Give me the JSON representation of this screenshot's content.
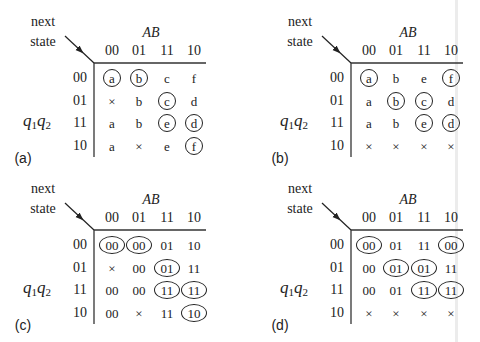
{
  "labels": {
    "next": "next",
    "state": "state",
    "ab": "AB",
    "q1": "q",
    "q1_sub": "1",
    "q2": "q",
    "q2_sub": "2"
  },
  "columns": [
    "00",
    "01",
    "11",
    "10"
  ],
  "rows": [
    "00",
    "01",
    "11",
    "10"
  ],
  "panels": [
    {
      "tag": "(a)",
      "cells": [
        [
          {
            "v": "a",
            "c": true
          },
          {
            "v": "b",
            "c": true
          },
          {
            "v": "c",
            "c": false
          },
          {
            "v": "f",
            "c": false
          }
        ],
        [
          {
            "v": "×",
            "c": false
          },
          {
            "v": "b",
            "c": false
          },
          {
            "v": "c",
            "c": true
          },
          {
            "v": "d",
            "c": false
          }
        ],
        [
          {
            "v": "a",
            "c": false
          },
          {
            "v": "b",
            "c": false
          },
          {
            "v": "e",
            "c": true
          },
          {
            "v": "d",
            "c": true
          }
        ],
        [
          {
            "v": "a",
            "c": false
          },
          {
            "v": "×",
            "c": false
          },
          {
            "v": "e",
            "c": false
          },
          {
            "v": "f",
            "c": true
          }
        ]
      ]
    },
    {
      "tag": "(b)",
      "cells": [
        [
          {
            "v": "a",
            "c": true
          },
          {
            "v": "b",
            "c": false
          },
          {
            "v": "e",
            "c": false
          },
          {
            "v": "f",
            "c": true
          }
        ],
        [
          {
            "v": "a",
            "c": false
          },
          {
            "v": "b",
            "c": true
          },
          {
            "v": "c",
            "c": true
          },
          {
            "v": "d",
            "c": false
          }
        ],
        [
          {
            "v": "a",
            "c": false
          },
          {
            "v": "b",
            "c": false
          },
          {
            "v": "e",
            "c": true
          },
          {
            "v": "d",
            "c": true
          }
        ],
        [
          {
            "v": "×",
            "c": false
          },
          {
            "v": "×",
            "c": false
          },
          {
            "v": "×",
            "c": false
          },
          {
            "v": "×",
            "c": false
          }
        ]
      ]
    },
    {
      "tag": "(c)",
      "cells": [
        [
          {
            "v": "00",
            "c": true
          },
          {
            "v": "00",
            "c": true
          },
          {
            "v": "01",
            "c": false
          },
          {
            "v": "10",
            "c": false
          }
        ],
        [
          {
            "v": "×",
            "c": false
          },
          {
            "v": "00",
            "c": false
          },
          {
            "v": "01",
            "c": true
          },
          {
            "v": "11",
            "c": false
          }
        ],
        [
          {
            "v": "00",
            "c": false
          },
          {
            "v": "00",
            "c": false
          },
          {
            "v": "11",
            "c": true
          },
          {
            "v": "11",
            "c": true
          }
        ],
        [
          {
            "v": "00",
            "c": false
          },
          {
            "v": "×",
            "c": false
          },
          {
            "v": "11",
            "c": false
          },
          {
            "v": "10",
            "c": true
          }
        ]
      ]
    },
    {
      "tag": "(d)",
      "cells": [
        [
          {
            "v": "00",
            "c": true
          },
          {
            "v": "01",
            "c": false
          },
          {
            "v": "11",
            "c": false
          },
          {
            "v": "00",
            "c": true
          }
        ],
        [
          {
            "v": "00",
            "c": false
          },
          {
            "v": "01",
            "c": true
          },
          {
            "v": "01",
            "c": true
          },
          {
            "v": "11",
            "c": false
          }
        ],
        [
          {
            "v": "00",
            "c": false
          },
          {
            "v": "01",
            "c": false
          },
          {
            "v": "11",
            "c": true
          },
          {
            "v": "11",
            "c": true
          }
        ],
        [
          {
            "v": "×",
            "c": false
          },
          {
            "v": "×",
            "c": false
          },
          {
            "v": "×",
            "c": false
          },
          {
            "v": "×",
            "c": false
          }
        ]
      ]
    }
  ]
}
